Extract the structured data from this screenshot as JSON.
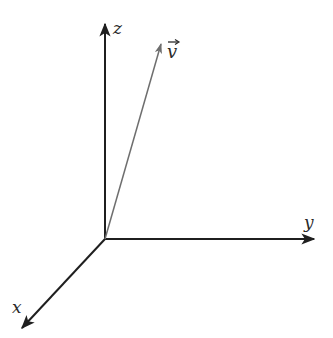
{
  "diagram": {
    "type": "3d-coordinate-axes",
    "origin": {
      "x": 105,
      "y": 239
    },
    "axes": [
      {
        "name": "z",
        "label": "z",
        "tip": {
          "x": 105,
          "y": 22
        },
        "label_pos": {
          "x": 113,
          "y": 34
        }
      },
      {
        "name": "y",
        "label": "y",
        "tip": {
          "x": 316,
          "y": 239
        },
        "label_pos": {
          "x": 304,
          "y": 227
        }
      },
      {
        "name": "x",
        "label": "x",
        "tip": {
          "x": 20,
          "y": 330
        },
        "label_pos": {
          "x": 12,
          "y": 313
        }
      }
    ],
    "vector": {
      "name": "v",
      "label": "v",
      "arrow_glyph": "→",
      "tip": {
        "x": 162,
        "y": 42
      },
      "label_pos": {
        "x": 168,
        "y": 57
      }
    },
    "colors": {
      "axis": "#1f1f1f",
      "vector": "#6e6e6e",
      "text": "#2a2a2a",
      "background": "#ffffff"
    }
  }
}
